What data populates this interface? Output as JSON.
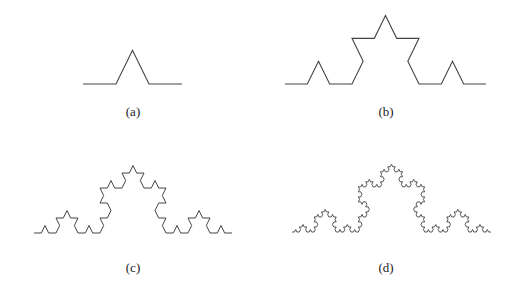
{
  "figure": {
    "stroke_color": "#444444",
    "background": "#ffffff",
    "vertical_scale": 1.18,
    "panels": [
      {
        "id": "a",
        "label": "(a)",
        "iterations": 1,
        "x0": 83,
        "x1": 182,
        "baseline_y": 84,
        "label_x": 133,
        "label_y": 104
      },
      {
        "id": "b",
        "label": "(b)",
        "iterations": 2,
        "x0": 285,
        "x1": 486,
        "baseline_y": 84,
        "label_x": 386,
        "label_y": 104
      },
      {
        "id": "c",
        "label": "(c)",
        "iterations": 3,
        "x0": 34,
        "x1": 232,
        "baseline_y": 233,
        "label_x": 133,
        "label_y": 260
      },
      {
        "id": "d",
        "label": "(d)",
        "iterations": 4,
        "x0": 292,
        "x1": 491,
        "baseline_y": 232,
        "label_x": 386,
        "label_y": 260
      }
    ]
  }
}
